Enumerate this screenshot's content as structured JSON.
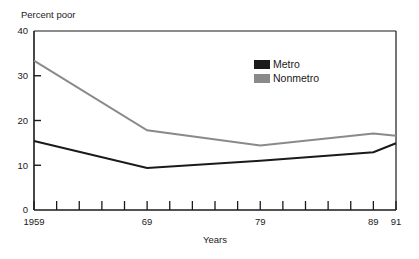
{
  "chart_data": {
    "type": "line",
    "title": "",
    "ylabel": "Percent poor",
    "xlabel": "Years",
    "ylim": [
      0,
      40
    ],
    "xlim": [
      1959,
      1991
    ],
    "grid": false,
    "legend_position": "upper-right-inside",
    "y_ticks": [
      0,
      10,
      20,
      30,
      40
    ],
    "y_tick_labels": [
      "0",
      "10",
      "20",
      "30",
      "40"
    ],
    "x_tick_labels": [
      "1959",
      "69",
      "79",
      "89",
      "91"
    ],
    "x_tick_label_years": [
      1959,
      1969,
      1979,
      1989,
      1991
    ],
    "x_minor_tick_years": [
      1959,
      1961,
      1963,
      1965,
      1967,
      1969,
      1971,
      1973,
      1975,
      1977,
      1979,
      1981,
      1983,
      1985,
      1987,
      1989,
      1991
    ],
    "x": [
      1959,
      1969,
      1979,
      1989,
      1991
    ],
    "series": [
      {
        "name": "Metro",
        "color": "#1a1a1a",
        "values": [
          15.4,
          9.4,
          11.0,
          12.9,
          14.9
        ]
      },
      {
        "name": "Nonmetro",
        "color": "#8a8a8a",
        "values": [
          33.4,
          17.8,
          14.4,
          17.1,
          16.6
        ]
      }
    ]
  },
  "axes": {
    "y_title": "Percent poor",
    "x_title": "Years",
    "y_tick_labels": [
      "40",
      "30",
      "20",
      "10",
      "0"
    ],
    "x_tick_labels": [
      "1959",
      "69",
      "79",
      "89",
      "91"
    ]
  },
  "legend": {
    "items": [
      {
        "label": "Metro",
        "color": "#1a1a1a",
        "swatch": "metro-swatch"
      },
      {
        "label": "Nonmetro",
        "color": "#8a8a8a",
        "swatch": "nonmetro-swatch"
      }
    ]
  },
  "colors": {
    "metro": "#1a1a1a",
    "nonmetro": "#8a8a8a",
    "frame": "#1a1a1a",
    "background": "#ffffff"
  }
}
